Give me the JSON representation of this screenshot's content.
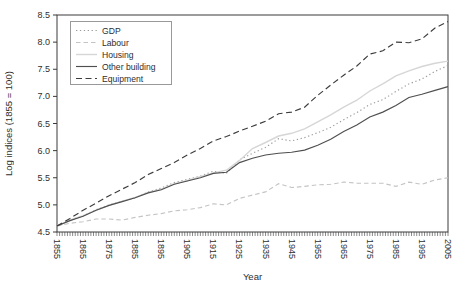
{
  "chart_data": {
    "type": "line",
    "title": "",
    "xlabel": "Year",
    "ylabel": "Log indices (1855 = 100)",
    "xlim": [
      1855,
      2005
    ],
    "ylim": [
      4.5,
      8.5
    ],
    "grid": "off",
    "legend_position": "top-left",
    "x_tick_labels": [
      "1855",
      "1865",
      "1875",
      "1885",
      "1895",
      "1905",
      "1915",
      "1925",
      "1935",
      "1945",
      "1955",
      "1965",
      "1975",
      "1985",
      "1995",
      "2005"
    ],
    "x_minor_tick_step": 1,
    "y_tick_labels": [
      "4.5",
      "5.0",
      "5.5",
      "6.0",
      "6.5",
      "7.0",
      "7.5",
      "8.0",
      "8.5"
    ],
    "x": [
      1855,
      1860,
      1865,
      1870,
      1875,
      1880,
      1885,
      1890,
      1895,
      1900,
      1905,
      1910,
      1915,
      1920,
      1925,
      1930,
      1935,
      1940,
      1945,
      1950,
      1955,
      1960,
      1965,
      1970,
      1975,
      1980,
      1985,
      1990,
      1995,
      2000,
      2005
    ],
    "series": [
      {
        "name": "GDP",
        "style": "dotted",
        "color": "#9b9b9b",
        "values": [
          4.61,
          4.72,
          4.8,
          4.91,
          5.0,
          5.07,
          5.13,
          5.24,
          5.31,
          5.41,
          5.47,
          5.53,
          5.62,
          5.58,
          5.83,
          5.95,
          6.06,
          6.22,
          6.18,
          6.24,
          6.33,
          6.43,
          6.57,
          6.7,
          6.85,
          6.94,
          7.09,
          7.23,
          7.32,
          7.46,
          7.57
        ]
      },
      {
        "name": "Labour",
        "style": "dashed",
        "color": "#c4c4c4",
        "values": [
          4.61,
          4.66,
          4.69,
          4.74,
          4.74,
          4.72,
          4.77,
          4.81,
          4.84,
          4.89,
          4.91,
          4.95,
          5.02,
          5.0,
          5.12,
          5.18,
          5.24,
          5.39,
          5.32,
          5.34,
          5.37,
          5.38,
          5.42,
          5.4,
          5.4,
          5.4,
          5.34,
          5.42,
          5.38,
          5.46,
          5.5
        ]
      },
      {
        "name": "Housing",
        "style": "solid",
        "color": "#d6d6d6",
        "values": [
          4.61,
          4.72,
          4.8,
          4.9,
          4.99,
          5.07,
          5.14,
          5.23,
          5.29,
          5.39,
          5.45,
          5.52,
          5.59,
          5.64,
          5.82,
          6.04,
          6.15,
          6.27,
          6.32,
          6.4,
          6.53,
          6.66,
          6.8,
          6.93,
          7.1,
          7.23,
          7.38,
          7.47,
          7.55,
          7.61,
          7.65
        ]
      },
      {
        "name": "Other building",
        "style": "solid",
        "color": "#4f4f4f",
        "values": [
          4.61,
          4.71,
          4.79,
          4.9,
          4.99,
          5.06,
          5.13,
          5.22,
          5.28,
          5.38,
          5.44,
          5.5,
          5.58,
          5.6,
          5.78,
          5.86,
          5.92,
          5.95,
          5.97,
          6.01,
          6.1,
          6.21,
          6.35,
          6.47,
          6.62,
          6.71,
          6.83,
          6.98,
          7.04,
          7.11,
          7.18
        ]
      },
      {
        "name": "Equipment",
        "style": "dashed",
        "color": "#3c3c3c",
        "values": [
          4.61,
          4.75,
          4.9,
          5.03,
          5.17,
          5.29,
          5.41,
          5.56,
          5.67,
          5.78,
          5.92,
          6.04,
          6.18,
          6.26,
          6.36,
          6.45,
          6.54,
          6.68,
          6.71,
          6.8,
          7.02,
          7.21,
          7.39,
          7.56,
          7.78,
          7.84,
          8.0,
          7.99,
          8.06,
          8.26,
          8.38
        ]
      }
    ]
  }
}
